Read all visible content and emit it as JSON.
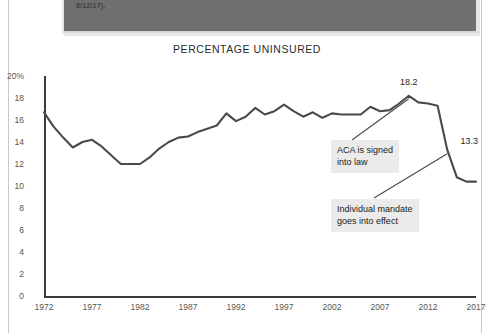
{
  "page": {
    "header_bar_text": "6/12/17)."
  },
  "chart_data": {
    "type": "line",
    "title": "PERCENTAGE UNINSURED",
    "xlabel": "",
    "ylabel": "",
    "grid": false,
    "legend": "none",
    "xlim": [
      1972,
      2017
    ],
    "ylim": [
      0,
      20
    ],
    "xticks": [
      "1972",
      "1977",
      "1982",
      "1987",
      "1992",
      "1997",
      "2002",
      "2007",
      "2012",
      "2017"
    ],
    "yticks": [
      "20%",
      "18",
      "16",
      "14",
      "12",
      "10",
      "8",
      "6",
      "4",
      "2",
      "0"
    ],
    "series": [
      {
        "name": "Percentage uninsured",
        "x": [
          1972,
          1973,
          1974,
          1975,
          1976,
          1977,
          1978,
          1979,
          1980,
          1981,
          1982,
          1983,
          1984,
          1985,
          1986,
          1987,
          1988,
          1989,
          1990,
          1991,
          1992,
          1993,
          1994,
          1995,
          1996,
          1997,
          1998,
          1999,
          2000,
          2001,
          2002,
          2003,
          2004,
          2005,
          2006,
          2007,
          2008,
          2009,
          2010,
          2011,
          2012,
          2013,
          2014,
          2015,
          2016,
          2017
        ],
        "values": [
          16.7,
          15.4,
          14.4,
          13.5,
          14.0,
          14.2,
          13.6,
          12.8,
          12.0,
          12.0,
          12.0,
          12.6,
          13.4,
          14.0,
          14.4,
          14.5,
          14.9,
          15.2,
          15.5,
          16.6,
          15.9,
          16.3,
          17.1,
          16.5,
          16.8,
          17.4,
          16.8,
          16.3,
          16.7,
          16.2,
          16.6,
          16.5,
          16.5,
          16.5,
          17.2,
          16.8,
          16.9,
          17.5,
          18.2,
          17.6,
          17.5,
          17.3,
          13.3,
          10.8,
          10.4,
          10.4
        ]
      }
    ],
    "point_labels": [
      {
        "text": "18.2",
        "x": 2010,
        "y": 18.2
      },
      {
        "text": "13.3",
        "x": 2014,
        "y": 13.3
      }
    ],
    "annotations": [
      {
        "text": "ACA is signed\ninto law",
        "target_x": 2010,
        "target_y": 18.2
      },
      {
        "text": "Individual mandate\ngoes into effect",
        "target_x": 2014,
        "target_y": 13.3
      }
    ]
  }
}
